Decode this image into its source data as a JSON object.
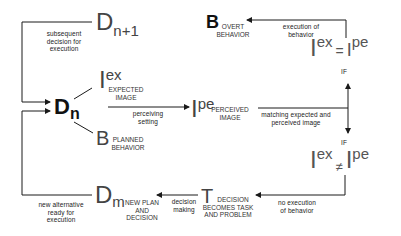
{
  "diagram": {
    "type": "flow-cycle",
    "colors": {
      "line": "#1a1a1a",
      "text": "#222222",
      "symbol": "#444444",
      "background": "#ffffff"
    },
    "nodes": {
      "d_n1": {
        "symbol": "D",
        "subscript": "n+1"
      },
      "d_n": {
        "symbol": "D",
        "subscript": "n"
      },
      "i_ex": {
        "symbol": "I",
        "superscript": "ex",
        "label_line1": "EXPECTED",
        "label_line2": "IMAGE"
      },
      "b_planned": {
        "symbol": "B",
        "label_line1": "PLANNED",
        "label_line2": "BEHAVIOR"
      },
      "i_pe": {
        "symbol": "I",
        "superscript": "pe",
        "label_line1": "PERCEIVED",
        "label_line2": "IMAGE"
      },
      "b_overt": {
        "symbol": "B",
        "label_line1": "OVERT",
        "label_line2": "BEHAVIOR"
      },
      "eq": {
        "left_symbol": "I",
        "left_sup": "ex",
        "operator": "=",
        "right_symbol": "I",
        "right_sup": "pe"
      },
      "neq": {
        "left_symbol": "I",
        "left_sup": "ex",
        "operator": "≠",
        "right_symbol": "I",
        "right_sup": "pe"
      },
      "if_top": "IF",
      "if_bottom": "IF",
      "t": {
        "symbol": "T",
        "label_line1": "DECISION",
        "label_line2": "BECOMES TASK",
        "label_line3": "AND PROBLEM"
      },
      "d_m": {
        "symbol": "D",
        "subscript": "m",
        "label_line1": "NEW PLAN",
        "label_line2": "AND",
        "label_line3": "DECISION"
      }
    },
    "edges": {
      "subsequent": {
        "line1": "subsequent",
        "line2": "decision for",
        "line3": "execution"
      },
      "perceiving": {
        "line1": "perceiving",
        "line2": "setting"
      },
      "matching": {
        "line1": "matching expected and",
        "line2": "perceived image"
      },
      "execution": {
        "line1": "execution of",
        "line2": "behavior"
      },
      "no_execution": {
        "line1": "no execution",
        "line2": "of behavior"
      },
      "decision_making": {
        "line1": "decision",
        "line2": "making"
      },
      "new_alternative": {
        "line1": "new alternative",
        "line2": "ready for",
        "line3": "execution"
      }
    }
  }
}
